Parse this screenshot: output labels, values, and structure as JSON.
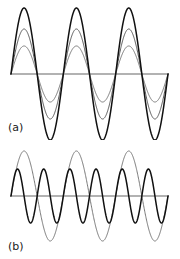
{
  "figure": {
    "background_color": "#ffffff",
    "width": 180,
    "height": 259
  },
  "panels": [
    {
      "key": "a",
      "label": "(a)",
      "baseline_y": 74,
      "x_start": 11,
      "x_end": 168
    },
    {
      "key": "b",
      "label": "(b)",
      "baseline_y": 196,
      "x_start": 11,
      "x_end": 168
    }
  ],
  "colors": {
    "curve_dark": "#111111",
    "curve_mid": "#555555",
    "curve_light": "#777777",
    "axis": "#666666",
    "label": "#1a1a1a"
  },
  "chart_data": [
    {
      "type": "line",
      "title": "(a)",
      "xlabel": "",
      "ylabel": "",
      "grid": false,
      "legend": "none",
      "axis_line": "horizontal zero baseline",
      "xlim": [
        0,
        3
      ],
      "ylim": [
        -70,
        70
      ],
      "description": "Three superimposed sinusoids of identical frequency (3 cycles) and identical phase, differing only in amplitude, producing nested arches.",
      "series": [
        {
          "name": "large amplitude sine",
          "color": "#111111",
          "amplitude": 66,
          "cycles": 3,
          "phase_deg": 0,
          "stroke_width": 1.5
        },
        {
          "name": "medium amplitude sine",
          "color": "#555555",
          "amplitude": 45,
          "cycles": 3,
          "phase_deg": 0,
          "stroke_width": 1.0
        },
        {
          "name": "small amplitude sine",
          "color": "#777777",
          "amplitude": 28,
          "cycles": 3,
          "phase_deg": 0,
          "stroke_width": 1.0
        }
      ]
    },
    {
      "type": "line",
      "title": "(b)",
      "xlabel": "",
      "ylabel": "",
      "grid": false,
      "legend": "none",
      "axis_line": "horizontal zero baseline",
      "xlim": [
        0,
        3
      ],
      "ylim": [
        -48,
        48
      ],
      "description": "Two superimposed sinusoids of different frequencies: a large-amplitude wave at 3 cycles and a smaller-amplitude wave at 6 cycles, creating overlapping lens shapes.",
      "series": [
        {
          "name": "low frequency large amplitude sine",
          "color": "#777777",
          "amplitude": 45,
          "cycles": 3,
          "phase_deg": 0,
          "stroke_width": 1.0
        },
        {
          "name": "high frequency small amplitude sine",
          "color": "#111111",
          "amplitude": 27,
          "cycles": 6,
          "phase_deg": 0,
          "stroke_width": 1.5
        }
      ]
    }
  ]
}
